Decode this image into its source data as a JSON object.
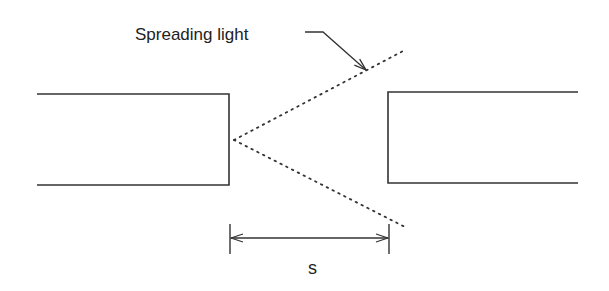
{
  "diagram": {
    "title_label": "Spreading light",
    "dimension_label": "s",
    "colors": {
      "stroke": "#333333",
      "background": "#ffffff"
    },
    "left_fiber": {
      "x1": 37,
      "x2": 229,
      "top": 94,
      "bottom": 185
    },
    "right_fiber": {
      "x1": 388,
      "x2": 578,
      "top": 92,
      "bottom": 183
    },
    "light_cone": {
      "vertex": [
        234,
        140
      ],
      "upper_end": [
        405,
        50
      ],
      "lower_end": [
        405,
        227
      ]
    },
    "dimension": {
      "x_left": 230,
      "x_right": 389,
      "y": 238
    }
  }
}
